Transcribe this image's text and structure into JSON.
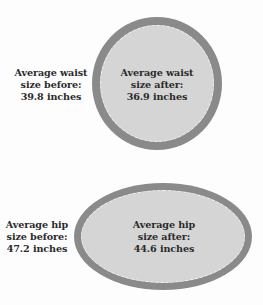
{
  "colors": {
    "ring": "#8a8a8a",
    "fill": "#d5d5d5",
    "dash": "#f4f4f4",
    "text": "#2b2b2b",
    "background": "#fdfdfd"
  },
  "waist": {
    "before": {
      "lines": [
        "Average waist",
        "size before:",
        "39.8 inches"
      ],
      "value": 39.8,
      "unit": "inches"
    },
    "after": {
      "lines": [
        "Average waist",
        "size after:",
        "36.9 inches"
      ],
      "value": 36.9,
      "unit": "inches"
    },
    "shape": "circle"
  },
  "hip": {
    "before": {
      "lines": [
        "Average hip",
        "size before:",
        "47.2 inches"
      ],
      "value": 47.2,
      "unit": "inches"
    },
    "after": {
      "lines": [
        "Average hip",
        "size after:",
        "44.6 inches"
      ],
      "value": 44.6,
      "unit": "inches"
    },
    "shape": "ellipse"
  }
}
